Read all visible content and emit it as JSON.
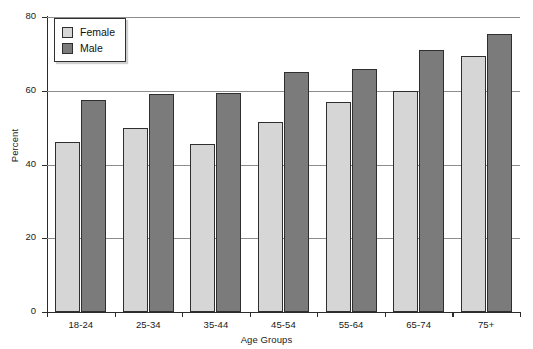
{
  "chart_data": {
    "type": "bar",
    "title": "",
    "subtitle": "",
    "xlabel": "Age Groups",
    "ylabel": "Percent",
    "categories": [
      "18-24",
      "25-34",
      "35-44",
      "45-54",
      "55-64",
      "65-74",
      "75+"
    ],
    "series": [
      {
        "name": "Female",
        "color": "#d6d6d6",
        "values": [
          46,
          50,
          45.5,
          51.5,
          57,
          60,
          69.5
        ]
      },
      {
        "name": "Male",
        "color": "#7b7b7b",
        "values": [
          57.5,
          59,
          59.5,
          65,
          66,
          71,
          75.5
        ]
      }
    ],
    "ylim": [
      0,
      80
    ],
    "yticks": [
      0,
      20,
      40,
      60,
      80
    ],
    "ytick_labels": [
      "0",
      "20",
      "40",
      "60",
      "80"
    ],
    "grid": "horizontal",
    "legend_position": "top-left",
    "legend_entries": [
      "Female",
      "Male"
    ]
  },
  "axes": {
    "y_title": "Percent",
    "x_title": "Age Groups"
  },
  "legend": {
    "items": [
      {
        "label": "Female",
        "swatch": "legend-swatch-female"
      },
      {
        "label": "Male",
        "swatch": "legend-swatch-male"
      }
    ]
  }
}
